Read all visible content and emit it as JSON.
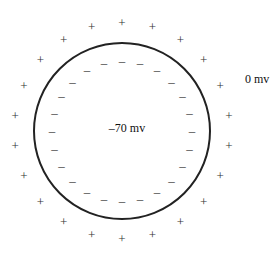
{
  "diagram": {
    "membrane": {
      "cx": 122,
      "cy": 131,
      "r": 88,
      "stroke": "#222222",
      "stroke_width": 2
    },
    "inside_label": "–70 mv",
    "outside_label": "0 mv",
    "outside_charge": {
      "symbol": "+",
      "count": 22,
      "radius": 108
    },
    "inside_charge": {
      "symbol": "–",
      "count": 24,
      "radius": 70
    }
  }
}
